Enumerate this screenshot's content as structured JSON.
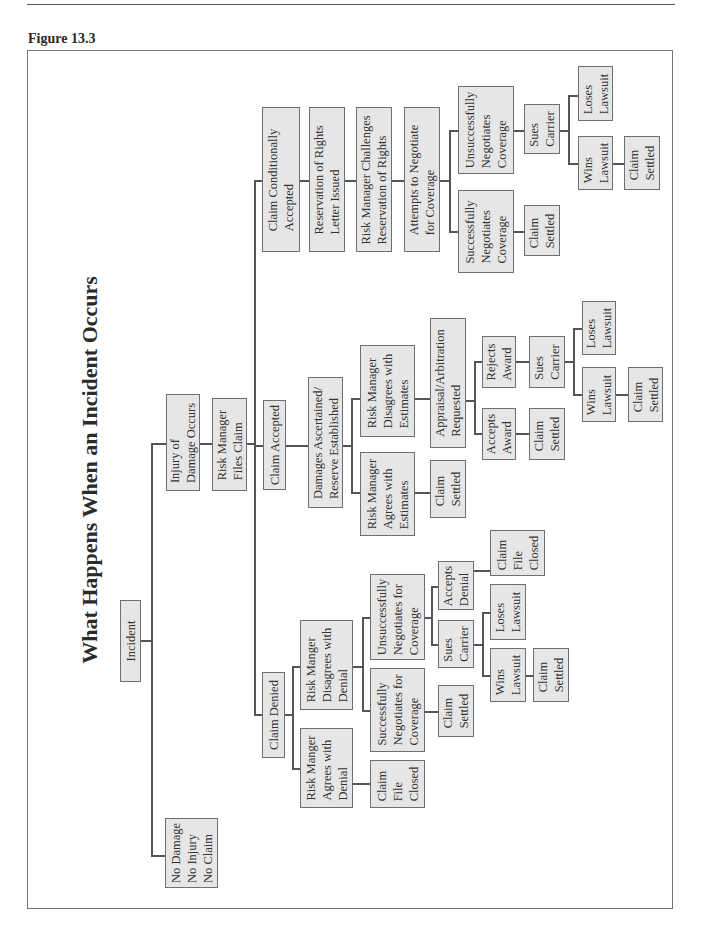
{
  "page": {
    "figure_label": "Figure 13.3",
    "title": "What Happens When an Incident Occurs"
  },
  "nodes": {
    "incident": "Incident",
    "no_damage": "No Damage\nNo Injury\nNo Claim",
    "injury_occurs": "Injury of\nDamage Occurs",
    "files_claim": "Risk Manager\nFiles Claim",
    "claim_cond_accepted": "Claim Conditionally\nAccepted",
    "claim_accepted": "Claim Accepted",
    "claim_denied": "Claim Denied",
    "ror_letter": "Reservation of Rights\nLetter Issued",
    "rm_challenges": "Risk Manager Challenges\nReservation of Rights",
    "attempts_negotiate": "Attempts to Negotiate\nfor Coverage",
    "cca_success": "Successfully\nNegotiates\nCoverage",
    "cca_unsuccess": "Unsuccessfully\nNegotiates\nCoverage",
    "cca_success_settled": "Claim\nSettled",
    "cca_sues": "Sues\nCarrier",
    "cca_loses": "Loses\nLawsuit",
    "cca_wins": "Wins\nLawsuit",
    "cca_wins_settled": "Claim\nSettled",
    "damages_ascertained": "Damages Ascertained/\nReserve Established",
    "rm_disagrees_est": "Risk Manager\nDisagrees with\nEstimates",
    "rm_agrees_est": "Risk Manager\nAgrees with\nEstimates",
    "agrees_est_settled": "Claim\nSettled",
    "appraisal": "Appraisal/Arbitration\nRequested",
    "rejects_award": "Rejects\nAward",
    "accepts_award": "Accepts\nAward",
    "accepts_award_settled": "Claim\nSettled",
    "ca_sues": "Sues\nCarrier",
    "ca_loses": "Loses\nLawsuit",
    "ca_wins": "Wins\nLawsuit",
    "ca_wins_settled": "Claim\nSettled",
    "rm_disagrees_denial": "Risk Manger\nDisagrees with\nDenial",
    "rm_agrees_denial": "Risk Manger\nAgrees with\nDenial",
    "agrees_denial_closed": "Claim\nFile\nClosed",
    "cd_success": "Successfully\nNegotiates for\nCoverage",
    "cd_unsuccess": "Unsuccessfully\nNegotiates for\nCoverage",
    "cd_success_settled": "Claim\nSettled",
    "cd_accepts_denial": "Accepts\nDenial",
    "cd_accepts_closed": "Claim\nFile\nClosed",
    "cd_sues": "Sues\nCarrier",
    "cd_loses": "Loses\nLawsuit",
    "cd_wins": "Wins\nLawsuit",
    "cd_wins_settled": "Claim\nSettled"
  }
}
